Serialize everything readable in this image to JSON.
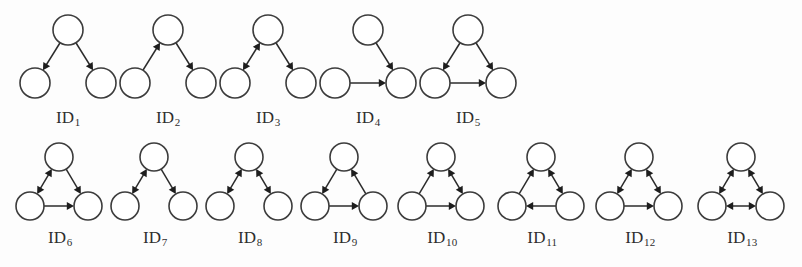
{
  "figure": {
    "background_color": "#fdfdfd",
    "node_fill": "#ffffff",
    "node_stroke": "#3c3c3c",
    "edge_color": "#2b2b2b",
    "label_color": "#2e2e2e",
    "rows": 2,
    "total_motifs": 13
  },
  "motifs": [
    {
      "id": 1,
      "label_prefix": "ID",
      "label_sub": "1",
      "row": 1,
      "nodes": [
        "top",
        "left",
        "right"
      ],
      "edges": [
        {
          "from": "top",
          "to": "left",
          "type": "single"
        },
        {
          "from": "top",
          "to": "right",
          "type": "single"
        }
      ]
    },
    {
      "id": 2,
      "label_prefix": "ID",
      "label_sub": "2",
      "row": 1,
      "nodes": [
        "top",
        "left",
        "right"
      ],
      "edges": [
        {
          "from": "left",
          "to": "top",
          "type": "single"
        },
        {
          "from": "top",
          "to": "right",
          "type": "single"
        }
      ]
    },
    {
      "id": 3,
      "label_prefix": "ID",
      "label_sub": "3",
      "row": 1,
      "nodes": [
        "top",
        "left",
        "right"
      ],
      "edges": [
        {
          "from": "top",
          "to": "left",
          "type": "mutual"
        },
        {
          "from": "top",
          "to": "right",
          "type": "single"
        }
      ]
    },
    {
      "id": 4,
      "label_prefix": "ID",
      "label_sub": "4",
      "row": 1,
      "nodes": [
        "top",
        "left",
        "right"
      ],
      "edges": [
        {
          "from": "top",
          "to": "right",
          "type": "single"
        },
        {
          "from": "left",
          "to": "right",
          "type": "single"
        }
      ]
    },
    {
      "id": 5,
      "label_prefix": "ID",
      "label_sub": "5",
      "row": 1,
      "nodes": [
        "top",
        "left",
        "right"
      ],
      "edges": [
        {
          "from": "top",
          "to": "left",
          "type": "single"
        },
        {
          "from": "top",
          "to": "right",
          "type": "single"
        },
        {
          "from": "left",
          "to": "right",
          "type": "single"
        }
      ]
    },
    {
      "id": 6,
      "label_prefix": "ID",
      "label_sub": "6",
      "row": 2,
      "nodes": [
        "top",
        "left",
        "right"
      ],
      "edges": [
        {
          "from": "top",
          "to": "left",
          "type": "mutual"
        },
        {
          "from": "top",
          "to": "right",
          "type": "single"
        },
        {
          "from": "left",
          "to": "right",
          "type": "single"
        }
      ]
    },
    {
      "id": 7,
      "label_prefix": "ID",
      "label_sub": "7",
      "row": 2,
      "nodes": [
        "top",
        "left",
        "right"
      ],
      "edges": [
        {
          "from": "top",
          "to": "left",
          "type": "mutual"
        },
        {
          "from": "top",
          "to": "right",
          "type": "single"
        }
      ]
    },
    {
      "id": 8,
      "label_prefix": "ID",
      "label_sub": "8",
      "row": 2,
      "nodes": [
        "top",
        "left",
        "right"
      ],
      "edges": [
        {
          "from": "top",
          "to": "left",
          "type": "mutual"
        },
        {
          "from": "top",
          "to": "right",
          "type": "mutual"
        }
      ]
    },
    {
      "id": 9,
      "label_prefix": "ID",
      "label_sub": "9",
      "row": 2,
      "nodes": [
        "top",
        "left",
        "right"
      ],
      "edges": [
        {
          "from": "top",
          "to": "left",
          "type": "single"
        },
        {
          "from": "right",
          "to": "top",
          "type": "single"
        },
        {
          "from": "left",
          "to": "right",
          "type": "single"
        }
      ]
    },
    {
      "id": 10,
      "label_prefix": "ID",
      "label_sub": "10",
      "row": 2,
      "nodes": [
        "top",
        "left",
        "right"
      ],
      "edges": [
        {
          "from": "left",
          "to": "top",
          "type": "single"
        },
        {
          "from": "top",
          "to": "right",
          "type": "mutual"
        },
        {
          "from": "left",
          "to": "right",
          "type": "single"
        }
      ]
    },
    {
      "id": 11,
      "label_prefix": "ID",
      "label_sub": "11",
      "row": 2,
      "nodes": [
        "top",
        "left",
        "right"
      ],
      "edges": [
        {
          "from": "left",
          "to": "top",
          "type": "single"
        },
        {
          "from": "top",
          "to": "right",
          "type": "mutual"
        },
        {
          "from": "right",
          "to": "left",
          "type": "single"
        }
      ]
    },
    {
      "id": 12,
      "label_prefix": "ID",
      "label_sub": "12",
      "row": 2,
      "nodes": [
        "top",
        "left",
        "right"
      ],
      "edges": [
        {
          "from": "top",
          "to": "left",
          "type": "mutual"
        },
        {
          "from": "top",
          "to": "right",
          "type": "mutual"
        },
        {
          "from": "left",
          "to": "right",
          "type": "single"
        }
      ]
    },
    {
      "id": 13,
      "label_prefix": "ID",
      "label_sub": "13",
      "row": 2,
      "nodes": [
        "top",
        "left",
        "right"
      ],
      "edges": [
        {
          "from": "top",
          "to": "left",
          "type": "mutual"
        },
        {
          "from": "top",
          "to": "right",
          "type": "mutual"
        },
        {
          "from": "left",
          "to": "right",
          "type": "mutual"
        }
      ]
    }
  ],
  "layout": {
    "row1": {
      "x_positions": [
        18,
        118,
        218,
        318,
        418
      ],
      "y": 8,
      "node_radius": 15,
      "top": [
        50,
        22
      ],
      "left": [
        17,
        75
      ],
      "right": [
        83,
        75
      ],
      "label_y": 100
    },
    "row2": {
      "x_positions": [
        10,
        105,
        200,
        295,
        392,
        492,
        590,
        692
      ],
      "y": 138,
      "node_radius": 14,
      "top": [
        49,
        19
      ],
      "left": [
        20,
        68
      ],
      "right": [
        78,
        68
      ],
      "label_y": 90
    }
  }
}
